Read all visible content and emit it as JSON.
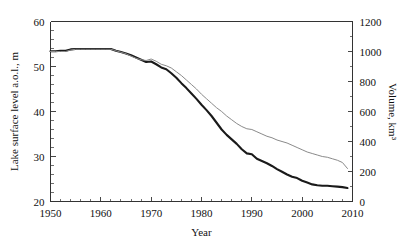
{
  "chart_data": {
    "type": "line",
    "title": "",
    "xlabel": "Year",
    "ylabel": "Lake surface level a.o.l., m",
    "y2label": "Volume, km³",
    "xlim": [
      1950,
      2010
    ],
    "ylim": [
      20,
      60
    ],
    "y2lim": [
      0,
      1200
    ],
    "xticks": [
      1950,
      1960,
      1970,
      1980,
      1990,
      2000,
      2010
    ],
    "xticklabels": [
      "1950",
      "1960",
      "1970",
      "1980",
      "1990",
      "2000",
      "2010"
    ],
    "yticks": [
      20,
      30,
      40,
      50,
      60
    ],
    "yticklabels": [
      "20",
      "30",
      "40",
      "50",
      "60"
    ],
    "y2ticks": [
      0,
      200,
      400,
      600,
      800,
      1000,
      1200
    ],
    "y2ticklabels": [
      "0",
      "200",
      "400",
      "600",
      "800",
      "1000",
      "1200"
    ],
    "grid": false,
    "legend": "none",
    "x": [
      1950,
      1951,
      1952,
      1953,
      1954,
      1955,
      1956,
      1957,
      1958,
      1959,
      1960,
      1961,
      1962,
      1963,
      1964,
      1965,
      1966,
      1967,
      1968,
      1969,
      1970,
      1971,
      1972,
      1973,
      1974,
      1975,
      1976,
      1977,
      1978,
      1979,
      1980,
      1981,
      1982,
      1983,
      1984,
      1985,
      1986,
      1987,
      1988,
      1989,
      1990,
      1991,
      1992,
      1993,
      1994,
      1995,
      1996,
      1997,
      1998,
      1999,
      2000,
      2001,
      2002,
      2003,
      2004,
      2005,
      2006,
      2007,
      2008,
      2009
    ],
    "series": [
      {
        "name": "Lake surface level a.o.l., m",
        "axis": "left",
        "style": "thick-black",
        "color": "#1a1a1a",
        "values": [
          53.4,
          53.4,
          53.5,
          53.5,
          53.8,
          53.9,
          53.9,
          53.9,
          53.9,
          53.9,
          53.9,
          53.9,
          53.9,
          53.5,
          53.2,
          52.9,
          52.5,
          52.0,
          51.5,
          51.0,
          51.1,
          50.5,
          49.8,
          49.4,
          48.5,
          47.5,
          46.3,
          45.2,
          44.0,
          42.8,
          41.5,
          40.3,
          39.0,
          37.5,
          36.0,
          34.8,
          33.8,
          32.8,
          31.6,
          30.7,
          30.5,
          29.5,
          29.0,
          28.5,
          27.9,
          27.2,
          26.6,
          26.0,
          25.5,
          25.2,
          24.6,
          24.2,
          23.8,
          23.6,
          23.5,
          23.5,
          23.4,
          23.3,
          23.2,
          23.0
        ]
      },
      {
        "name": "Volume, km³",
        "axis": "right",
        "style": "thin-gray",
        "color": "#8a8a8a",
        "values": [
          1000,
          1000,
          1000,
          1000,
          1010,
          1015,
          1015,
          1015,
          1015,
          1015,
          1015,
          1015,
          1015,
          1005,
          995,
          985,
          970,
          955,
          945,
          940,
          950,
          935,
          915,
          905,
          890,
          865,
          840,
          810,
          780,
          750,
          715,
          685,
          655,
          625,
          600,
          570,
          545,
          520,
          500,
          485,
          480,
          465,
          450,
          435,
          425,
          410,
          400,
          390,
          375,
          360,
          345,
          330,
          320,
          310,
          300,
          295,
          285,
          275,
          260,
          220
        ]
      }
    ]
  }
}
